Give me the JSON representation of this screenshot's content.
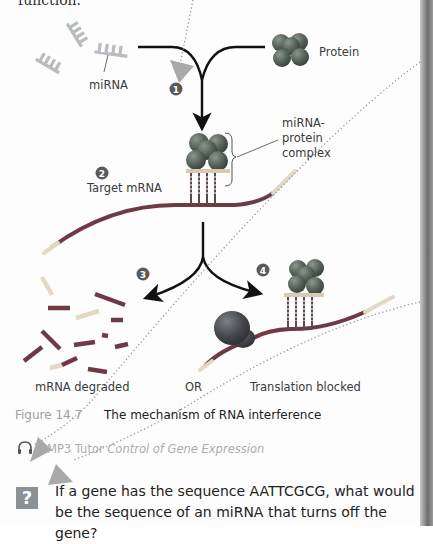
{
  "page": {
    "top_text": "function.",
    "figure": {
      "labels": {
        "mirna": "miRNA",
        "protein": "Protein",
        "complex_line1": "miRNA-",
        "complex_line2": "protein",
        "complex_line3": "complex",
        "target_mrna": "Target mRNA",
        "degraded": "mRNA degraded",
        "or": "OR",
        "blocked": "Translation blocked"
      },
      "steps": [
        "1",
        "2",
        "3",
        "4"
      ],
      "caption_number": "Figure 14.7",
      "caption_title": "The mechanism of RNA interference"
    },
    "mp3_tutor": {
      "icon": "headphones-icon",
      "prefix": "MP3 Tutor",
      "title": "Control of Gene Expression"
    },
    "question": {
      "icon": "question-mark-icon",
      "icon_glyph": "?",
      "text": "If a gene has the sequence AATTCGCG, what would be the sequence of an miRNA that turns off the gene?"
    },
    "annotation_markers": [
      "arrow-marker-1",
      "arrow-marker-2",
      "arrow-marker-3"
    ],
    "colors": {
      "mrna_dark": "#6f3a45",
      "mrna_light": "#e3d8c4",
      "mirna": "#b8bcc0",
      "protein": "#5d6b61",
      "step_badge": "#5a5a5a",
      "caption_grey": "#9aa0a6",
      "marker": "#a9a9a9"
    }
  }
}
